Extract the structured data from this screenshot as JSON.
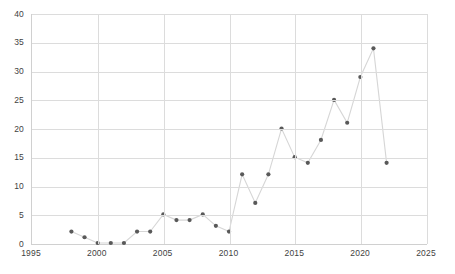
{
  "chart_data": {
    "type": "scatter",
    "title": "",
    "subtitle": "",
    "xlabel": "",
    "ylabel": "",
    "xlim": [
      1995,
      2025
    ],
    "ylim": [
      0,
      40
    ],
    "xticks": [
      1995,
      2000,
      2005,
      2010,
      2015,
      2020,
      2025
    ],
    "yticks": [
      0,
      5,
      10,
      15,
      20,
      25,
      30,
      35,
      40
    ],
    "grid": true,
    "legend": false,
    "legend_position": "none",
    "marker": "circle",
    "marker_color": "#595959",
    "line_color": "#d6d6d6",
    "gridline_color": "#dcdcdc",
    "axis_color": "#d0d0d0",
    "background": "#ffffff",
    "x": [
      1998,
      1999,
      2000,
      2001,
      2002,
      2003,
      2004,
      2005,
      2006,
      2007,
      2008,
      2009,
      2010,
      2011,
      2012,
      2013,
      2014,
      2015,
      2016,
      2017,
      2018,
      2019,
      2020,
      2021,
      2022
    ],
    "values": [
      2,
      1,
      0,
      0,
      0,
      2,
      2,
      5,
      4,
      4,
      5,
      3,
      2,
      12,
      7,
      12,
      20,
      15,
      14,
      18,
      25,
      21,
      29,
      34,
      14
    ],
    "series": [
      {
        "name": "publications",
        "x": [
          1998,
          1999,
          2000,
          2001,
          2002,
          2003,
          2004,
          2005,
          2006,
          2007,
          2008,
          2009,
          2010,
          2011,
          2012,
          2013,
          2014,
          2015,
          2016,
          2017,
          2018,
          2019,
          2020,
          2021,
          2022
        ],
        "values": [
          2,
          1,
          0,
          0,
          0,
          2,
          2,
          5,
          4,
          4,
          5,
          3,
          2,
          12,
          7,
          12,
          20,
          15,
          14,
          18,
          25,
          21,
          29,
          34,
          14
        ]
      }
    ],
    "annotations": []
  },
  "caption": {
    "text": ""
  }
}
